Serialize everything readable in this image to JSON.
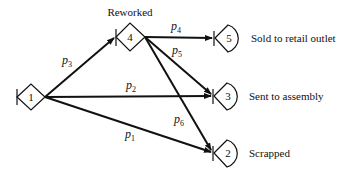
{
  "diagram": {
    "nodes": [
      {
        "id": "1",
        "label": "1",
        "shape": "diamond",
        "cx": 31,
        "cy": 97,
        "caption": ""
      },
      {
        "id": "4",
        "label": "4",
        "shape": "diamond",
        "cx": 130,
        "cy": 37,
        "caption": "Reworked"
      },
      {
        "id": "5",
        "label": "5",
        "shape": "wedge",
        "cx": 214,
        "cy": 38,
        "caption": "Sold to retail outlet"
      },
      {
        "id": "3",
        "label": "3",
        "shape": "wedge",
        "cx": 213,
        "cy": 96,
        "caption": "Sent to assembly"
      },
      {
        "id": "2",
        "label": "2",
        "shape": "wedge",
        "cx": 213,
        "cy": 153,
        "caption": "Scrapped"
      }
    ],
    "edges": [
      {
        "from": "1",
        "to": "4",
        "label": "p",
        "sub": "3"
      },
      {
        "from": "1",
        "to": "3",
        "label": "p",
        "sub": "2"
      },
      {
        "from": "1",
        "to": "2",
        "label": "p",
        "sub": "1"
      },
      {
        "from": "4",
        "to": "5",
        "label": "p",
        "sub": "4"
      },
      {
        "from": "4",
        "to": "3",
        "label": "p",
        "sub": "5"
      },
      {
        "from": "4",
        "to": "2",
        "label": "p",
        "sub": "6"
      }
    ]
  }
}
